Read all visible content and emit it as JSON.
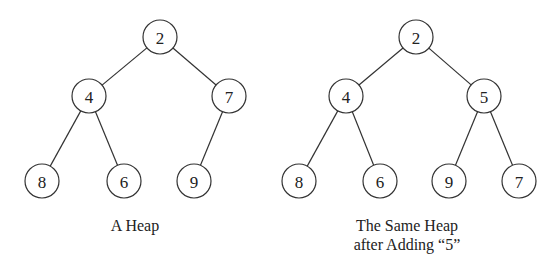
{
  "diagram": {
    "type": "binary-heap-comparison",
    "trees": [
      {
        "name": "original-heap",
        "caption_lines": [
          "A Heap"
        ],
        "nodes": [
          {
            "id": "a0",
            "label": "2",
            "x": 160,
            "y": 37
          },
          {
            "id": "a1",
            "label": "4",
            "x": 89,
            "y": 96
          },
          {
            "id": "a2",
            "label": "7",
            "x": 229,
            "y": 96
          },
          {
            "id": "a3",
            "label": "8",
            "x": 42,
            "y": 181
          },
          {
            "id": "a4",
            "label": "6",
            "x": 124,
            "y": 181
          },
          {
            "id": "a5",
            "label": "9",
            "x": 194,
            "y": 181
          }
        ],
        "edges": [
          [
            "a0",
            "a1"
          ],
          [
            "a0",
            "a2"
          ],
          [
            "a1",
            "a3"
          ],
          [
            "a1",
            "a4"
          ],
          [
            "a2",
            "a5"
          ]
        ]
      },
      {
        "name": "heap-after-adding-5",
        "caption_lines": [
          "The Same Heap",
          "after Adding “5”"
        ],
        "nodes": [
          {
            "id": "b0",
            "label": "2",
            "x": 416,
            "y": 37
          },
          {
            "id": "b1",
            "label": "4",
            "x": 346,
            "y": 96
          },
          {
            "id": "b2",
            "label": "5",
            "x": 484,
            "y": 96
          },
          {
            "id": "b3",
            "label": "8",
            "x": 299,
            "y": 181
          },
          {
            "id": "b4",
            "label": "6",
            "x": 380,
            "y": 181
          },
          {
            "id": "b5",
            "label": "9",
            "x": 449,
            "y": 181
          },
          {
            "id": "b6",
            "label": "7",
            "x": 519,
            "y": 181
          }
        ],
        "edges": [
          [
            "b0",
            "b1"
          ],
          [
            "b0",
            "b2"
          ],
          [
            "b1",
            "b3"
          ],
          [
            "b1",
            "b4"
          ],
          [
            "b2",
            "b5"
          ],
          [
            "b2",
            "b6"
          ]
        ]
      }
    ],
    "node_radius": 17
  }
}
